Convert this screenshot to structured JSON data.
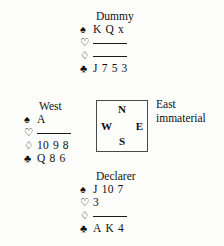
{
  "diagram": {
    "type": "bridge-hand-diagram",
    "ink_color": "#111111",
    "background_color": "#fdfdfc",
    "box_border_color": "#4a4a4a"
  },
  "suits": {
    "spade": {
      "symbol": "♠",
      "name": "spade-symbol",
      "filled": true
    },
    "heart": {
      "symbol": "♡",
      "name": "heart-symbol",
      "filled": false
    },
    "diamond": {
      "symbol": "♢",
      "name": "diamond-symbol",
      "filled": false
    },
    "club": {
      "symbol": "♣",
      "name": "club-symbol",
      "filled": true
    }
  },
  "hands": {
    "dummy": {
      "title": "Dummy",
      "spades": "K Q x",
      "hearts": "",
      "diamonds": "",
      "clubs": "J 7 5 3"
    },
    "west": {
      "title": "West",
      "spades": "A",
      "hearts": "",
      "diamonds": "10 9 8",
      "clubs": "Q 8 6"
    },
    "declarer": {
      "title": "Declarer",
      "spades": "J 10 7",
      "hearts": "3",
      "diamonds": "",
      "clubs": "A K 4"
    },
    "east": {
      "title": "East",
      "note": "immaterial"
    }
  },
  "compass": {
    "north": "N",
    "south": "S",
    "west": "W",
    "east": "E"
  }
}
